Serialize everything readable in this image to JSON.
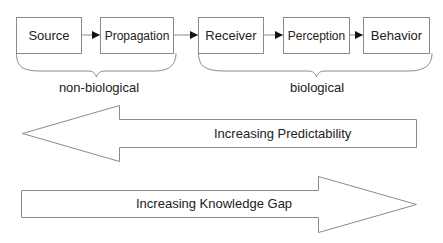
{
  "diagram": {
    "stages": [
      {
        "label": "Source"
      },
      {
        "label": "Propagation"
      },
      {
        "label": "Receiver"
      },
      {
        "label": "Perception"
      },
      {
        "label": "Behavior"
      }
    ],
    "groups": [
      {
        "label": "non-biological",
        "spans": [
          "Source",
          "Propagation"
        ]
      },
      {
        "label": "biological",
        "spans": [
          "Receiver",
          "Perception",
          "Behavior"
        ]
      }
    ],
    "trend_arrows": [
      {
        "label": "Increasing Predictability",
        "direction": "left"
      },
      {
        "label": "Increasing Knowledge Gap",
        "direction": "right"
      }
    ],
    "colors": {
      "stroke": "#8a8a8a",
      "arrowhead": "#111111",
      "text": "#222222"
    }
  }
}
